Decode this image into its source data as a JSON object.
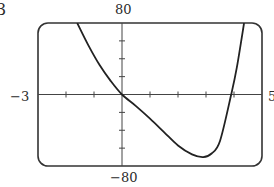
{
  "exercise_number": "3",
  "chart_data": {
    "type": "line",
    "title": "",
    "xlabel": "",
    "ylabel": "",
    "xlim": [
      -3,
      5
    ],
    "ylim": [
      -80,
      80
    ],
    "x_tick_step": 1,
    "y_tick_step": 20,
    "grid": false,
    "tick_labels": {
      "xmin": "−3",
      "xmax": "5",
      "ymax": "80",
      "ymin": "−80"
    },
    "series": [
      {
        "name": "f(x)",
        "x": [
          -1.6,
          -1.2,
          -0.8,
          -0.4,
          0,
          0.5,
          1.0,
          1.5,
          2.0,
          2.5,
          2.9,
          3.2,
          3.5,
          3.9,
          4.1,
          4.36
        ],
        "y": [
          80,
          55,
          33,
          15,
          0,
          -13,
          -27,
          -42,
          -57,
          -67,
          -70,
          -66,
          -52,
          0,
          30,
          80
        ]
      }
    ]
  }
}
